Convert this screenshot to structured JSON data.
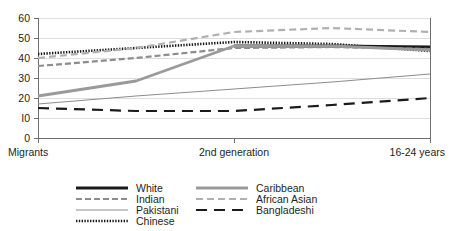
{
  "chart_data": {
    "type": "line",
    "title": "",
    "subtitle": "",
    "xlabel": "",
    "ylabel": "",
    "grid": true,
    "legend_position": "bottom",
    "ylim": [
      0,
      60
    ],
    "yticks": [
      0,
      10,
      20,
      30,
      40,
      50,
      60
    ],
    "ytick_labels": [
      "0",
      "I0",
      "20",
      "30",
      "40",
      "50",
      "60"
    ],
    "x": [
      0,
      1,
      2
    ],
    "categories": [
      "Migrants",
      "2nd generation",
      "16-24 years"
    ],
    "xtick_labels": [
      "Migrants",
      "2nd generation",
      "16-24 years"
    ],
    "series": [
      {
        "name": "White",
        "style": "solid-thick",
        "color": "#1a1a1a",
        "width": 3.2,
        "dash": "none",
        "x": [
          1,
          1.5,
          2
        ],
        "values": [
          46,
          46,
          45.5
        ]
      },
      {
        "name": "Indian",
        "style": "dashed",
        "color": "#8c8c8c",
        "width": 2.2,
        "dash": "6,3",
        "x": [
          0,
          0.5,
          1,
          1.5,
          2
        ],
        "values": [
          36,
          40,
          45,
          45.5,
          44.5
        ]
      },
      {
        "name": "Pakistani",
        "style": "solid-thin",
        "color": "#8c8c8c",
        "width": 1,
        "dash": "none",
        "x": [
          0,
          0.5,
          1,
          1.5,
          2
        ],
        "values": [
          17,
          21,
          24.5,
          28,
          32
        ]
      },
      {
        "name": "Chinese",
        "style": "dotted",
        "color": "#1a1a1a",
        "width": 2.6,
        "dash": "1.4,1.4",
        "x": [
          0,
          0.5,
          1,
          1.5,
          2
        ],
        "values": [
          42,
          45,
          48,
          47,
          43.5
        ]
      },
      {
        "name": "Caribbean",
        "style": "solid-medium",
        "color": "#9a9a9a",
        "width": 2.8,
        "dash": "none",
        "x": [
          0,
          0.5,
          1,
          1.5,
          2
        ],
        "values": [
          21,
          28.5,
          46,
          46,
          44
        ]
      },
      {
        "name": "African Asian",
        "style": "dashed-light",
        "color": "#b0b0b0",
        "width": 2.2,
        "dash": "7,4",
        "x": [
          0,
          0.5,
          1,
          1.5,
          2
        ],
        "values": [
          40,
          45,
          53,
          55,
          53
        ]
      },
      {
        "name": "Bangladeshi",
        "style": "long-dash",
        "color": "#1a1a1a",
        "width": 2.2,
        "dash": "11,7",
        "x": [
          0,
          0.5,
          1,
          1.5,
          2
        ],
        "values": [
          15,
          13.5,
          13.5,
          16.5,
          20
        ]
      }
    ]
  },
  "axis": {
    "y_ticks": [
      "60",
      "50",
      "40",
      "30",
      "20",
      "I0",
      "0"
    ],
    "x_ticks": [
      "Migrants",
      "2nd generation",
      "16-24 years"
    ]
  },
  "legend": {
    "column_one": [
      {
        "label": "White",
        "key": "White"
      },
      {
        "label": "Indian",
        "key": "Indian"
      },
      {
        "label": "Pakistani",
        "key": "Pakistani"
      },
      {
        "label": "Chinese",
        "key": "Chinese"
      }
    ],
    "column_two": [
      {
        "label": "Caribbean",
        "key": "Caribbean"
      },
      {
        "label": "African Asian",
        "key": "African Asian"
      },
      {
        "label": "Bangladeshi",
        "key": "Bangladeshi"
      }
    ]
  }
}
